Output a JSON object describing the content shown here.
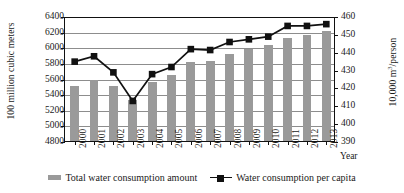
{
  "chart_data": {
    "type": "bar",
    "title": "",
    "xlabel": "Year",
    "categories": [
      "2000",
      "2001",
      "2002",
      "2003",
      "2004",
      "2005",
      "2006",
      "2007",
      "2008",
      "2009",
      "2010",
      "2011",
      "2012",
      "2013"
    ],
    "grid": true,
    "legend_position": "bottom",
    "axes": {
      "left": {
        "label": "100 million cubic meters",
        "ylim": [
          4800,
          6400
        ],
        "ticks": [
          4800,
          5000,
          5200,
          5400,
          5600,
          5800,
          6000,
          6200,
          6400
        ],
        "tick_labels": [
          "4800",
          "5000",
          "5200",
          "5400",
          "5600",
          "5800",
          "6000",
          "6200",
          "6400"
        ]
      },
      "right": {
        "label": "10,000 m3/person",
        "label_prefix": "10,000 m",
        "label_sup": "3",
        "label_suffix": "/person",
        "ylim": [
          390,
          460
        ],
        "ticks": [
          390,
          400,
          410,
          420,
          430,
          440,
          450,
          460
        ],
        "tick_labels": [
          "390",
          "400",
          "410",
          "420",
          "430",
          "440",
          "450",
          "460"
        ]
      }
    },
    "series": [
      {
        "name": "Total water consumption amount",
        "type": "bar",
        "axis": "left",
        "color": "#9a9a9a",
        "values": [
          5500,
          5580,
          5500,
          5320,
          5560,
          5640,
          5810,
          5830,
          5920,
          5980,
          6030,
          6120,
          6160,
          6210
        ]
      },
      {
        "name": "Water consumption per capita",
        "type": "line",
        "axis": "right",
        "color": "#111111",
        "marker": "square",
        "values": [
          435,
          438,
          429,
          413,
          428,
          432,
          442,
          441.5,
          446,
          447.5,
          449,
          455,
          455,
          456
        ]
      }
    ]
  },
  "legend": {
    "items": [
      {
        "label": "Total water consumption amount",
        "swatch": "bar-swatch"
      },
      {
        "label": "Water consumption per capita",
        "swatch": "line-marker-swatch"
      }
    ]
  }
}
